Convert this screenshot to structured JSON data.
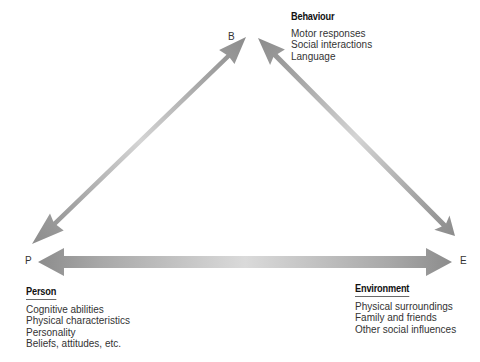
{
  "diagram": {
    "nodes": {
      "behaviour": {
        "letter": "B",
        "heading": "Behaviour",
        "items": [
          "Motor responses",
          "Social interactions",
          "Language"
        ]
      },
      "person": {
        "letter": "P",
        "heading": "Person",
        "items": [
          "Cognitive abilities",
          "Physical characteristics",
          "Personality",
          "Beliefs, attitudes, etc."
        ]
      },
      "environment": {
        "letter": "E",
        "heading": "Environment",
        "items": [
          "Physical surroundings",
          "Family and friends",
          "Other social influences"
        ]
      }
    },
    "edges": [
      {
        "from": "P",
        "to": "B",
        "type": "double-headed-arrow"
      },
      {
        "from": "B",
        "to": "E",
        "type": "double-headed-arrow"
      },
      {
        "from": "P",
        "to": "E",
        "type": "double-headed-arrow"
      }
    ],
    "colors": {
      "arrow_dark": "#8c8c8c",
      "arrow_light": "#d9d9d9",
      "text": "#333333",
      "heading": "#111111",
      "underline": "#6a6a6a"
    }
  }
}
